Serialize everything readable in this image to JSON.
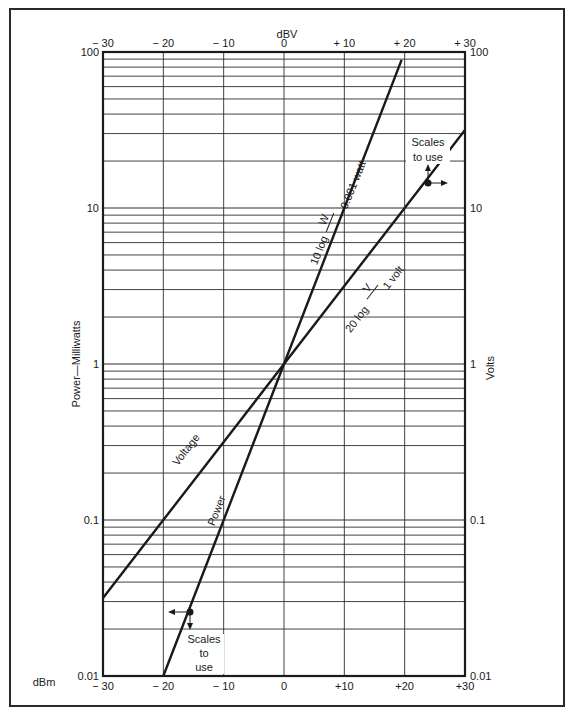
{
  "chart_data": {
    "type": "line",
    "title": "",
    "top_axis_label": "dBV",
    "bottom_axis_label": "dBm",
    "left_axis_label": "Power—Milliwatts",
    "right_axis_label": "Volts",
    "x_range": [
      -30,
      30
    ],
    "y_scale": "log",
    "y_range": [
      0.01,
      100
    ],
    "top_ticks": [
      "− 30",
      "− 20",
      "− 10",
      "0",
      "+ 10",
      "+ 20",
      "+ 30"
    ],
    "bottom_ticks": [
      "− 30",
      "− 20",
      "− 10",
      "0",
      "+10",
      "+20",
      "+30"
    ],
    "left_ticks": [
      "100",
      "10",
      "1",
      "0.1",
      "0.01"
    ],
    "right_ticks": [
      "100",
      "10",
      "1",
      "0.1",
      "0.01"
    ],
    "grid": true,
    "series": [
      {
        "name": "Power",
        "x_axis": "dBm",
        "y_axis": "Power—Milliwatts",
        "formula": "10 log W/0.001 watt",
        "x": [
          -20,
          -10,
          0,
          10,
          19.5
        ],
        "y": [
          0.01,
          0.1,
          1,
          10,
          89
        ]
      },
      {
        "name": "Voltage",
        "x_axis": "dBV",
        "y_axis": "Volts",
        "formula": "20 log V/1 volt",
        "x": [
          -30,
          -20,
          -10,
          0,
          10,
          20,
          30
        ],
        "y": [
          0.0316,
          0.1,
          0.316,
          1,
          3.16,
          10,
          31.6
        ]
      }
    ],
    "annotations": [
      {
        "text": "Scales to use",
        "at_series": "Voltage",
        "point": [
          24,
          15.8
        ],
        "arrows": [
          "up",
          "right"
        ]
      },
      {
        "text": "Scales to use",
        "at_series": "Power",
        "point": [
          -15.5,
          0.028
        ],
        "arrows": [
          "left",
          "down"
        ]
      },
      {
        "text": "10 log W/0.001 watt",
        "series": "Power"
      },
      {
        "text": "20 log V/1 volt",
        "series": "Voltage"
      }
    ]
  },
  "labels": {
    "dbv": "dBV",
    "dbm": "dBm",
    "left_axis": "Power—Milliwatts",
    "right_axis": "Volts",
    "voltage": "Voltage",
    "power": "Power",
    "power_formula_prefix": "10 log",
    "power_formula_num": "W",
    "power_formula_den": "0.001 watt",
    "voltage_formula_prefix": "20 log",
    "voltage_formula_num": "V",
    "voltage_formula_den": "1 volt",
    "scales_line1": "Scales",
    "scales_line2": "to use",
    "scales_b_line1": "Scales",
    "scales_b_line2": "to",
    "scales_b_line3": "use"
  },
  "colors": {
    "ink": "#1a1a1a",
    "grid": "#2e2e2e",
    "background": "#ffffff"
  }
}
